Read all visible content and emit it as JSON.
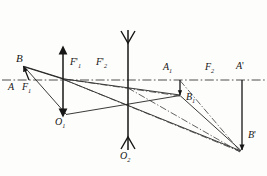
{
  "figure": {
    "type": "optics-ray-diagram",
    "background_color": "#fdfdfb",
    "ink_color": "#161616"
  },
  "axis": {
    "name": "optical-axis",
    "style": "dash-dot",
    "y": 80,
    "x_start": 0,
    "x_end": 267
  },
  "lenses": [
    {
      "name": "lens-1",
      "x": 63,
      "y_top": 48,
      "y_bottom": 115,
      "style": "double-arrow-converging",
      "center_label": "O1"
    },
    {
      "name": "lens-2",
      "x": 128,
      "y_top": 30,
      "y_bottom": 150,
      "style": "concave-diverging",
      "center_label": "O2"
    }
  ],
  "labels": {
    "object_B": "B",
    "object_A": "A",
    "focal_F1": "F",
    "focal_F1_sub": "1",
    "focal_F1p": "F",
    "focal_F1p_sub": "1",
    "focal_F2p": "F",
    "focal_F2p_sub": "2",
    "focal_F2": "F",
    "focal_F2_sub": "2",
    "image_A1": "A",
    "image_A1_sub": "1",
    "image_B1": "B",
    "image_B1_sub": "1",
    "image_Ap": "A",
    "image_Bp": "B",
    "center_O1": "O",
    "center_O1_sub": "1",
    "center_O2": "O",
    "center_O2_sub": "2",
    "prime": "'"
  },
  "points": {
    "A": {
      "x": 28,
      "y": 80
    },
    "B": {
      "x": 22,
      "y": 64
    },
    "O1": {
      "x": 63,
      "y": 80
    },
    "O2": {
      "x": 128,
      "y": 80
    },
    "A1": {
      "x": 180,
      "y": 80
    },
    "B1": {
      "x": 180,
      "y": 97
    },
    "Ap": {
      "x": 242,
      "y": 80
    },
    "Bp": {
      "x": 242,
      "y": 152
    }
  },
  "arrows": [
    {
      "name": "object-arrow-AB",
      "from": "A",
      "to": "B",
      "head": "at-B"
    },
    {
      "name": "intermediate-image-arrow-A1B1",
      "from": "A1",
      "to": "B1",
      "head": "at-B1"
    },
    {
      "name": "final-image-arrow-ApBp",
      "from": "Ap",
      "to": "Bp",
      "head": "at-Bp"
    }
  ],
  "rays": [
    {
      "name": "ray-B-to-lens1-top",
      "style": "solid"
    },
    {
      "name": "ray-B-through-O1",
      "style": "solid"
    },
    {
      "name": "ray-lens1-to-B1",
      "style": "solid"
    },
    {
      "name": "ray-O1-to-B1",
      "style": "solid"
    },
    {
      "name": "ray-B1-to-Bp",
      "style": "solid"
    },
    {
      "name": "ray-construction-upper",
      "style": "dash-dot"
    },
    {
      "name": "ray-construction-lower",
      "style": "dash-dot"
    }
  ]
}
